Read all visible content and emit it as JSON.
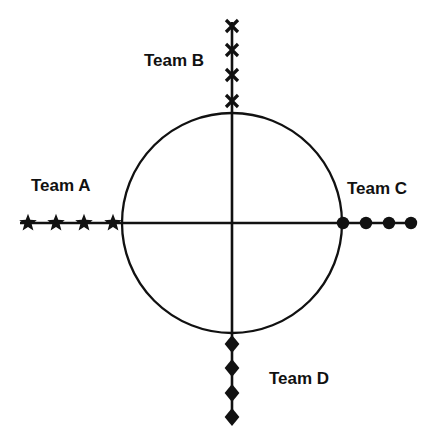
{
  "figure": {
    "title": "",
    "background_color": "#ffffff",
    "stroke_color": "#111111",
    "width": 431,
    "height": 440
  },
  "chart_data": {
    "type": "scatter",
    "title": "",
    "xlabel": "",
    "ylabel": "",
    "grid": false,
    "legend_position": "inline-axis-labels",
    "center": {
      "x": 232,
      "y": 223
    },
    "circle": {
      "cx": 232,
      "cy": 223,
      "r": 110,
      "label": "unit-circle"
    },
    "axes": {
      "horizontal": {
        "x1": 20,
        "x2": 415,
        "y": 223
      },
      "vertical": {
        "y1": 22,
        "y2": 420,
        "x": 232
      }
    },
    "series": [
      {
        "name": "Team A",
        "direction": "left",
        "marker": "star",
        "count": 4,
        "points": [
          {
            "x": 28,
            "y": 223
          },
          {
            "x": 56,
            "y": 223
          },
          {
            "x": 84,
            "y": 223
          },
          {
            "x": 113,
            "y": 223
          }
        ]
      },
      {
        "name": "Team B",
        "direction": "up",
        "marker": "x",
        "count": 4,
        "points": [
          {
            "x": 232,
            "y": 26
          },
          {
            "x": 232,
            "y": 50
          },
          {
            "x": 232,
            "y": 75
          },
          {
            "x": 232,
            "y": 101
          }
        ]
      },
      {
        "name": "Team C",
        "direction": "right",
        "marker": "circle",
        "count": 4,
        "points": [
          {
            "x": 343,
            "y": 223
          },
          {
            "x": 366,
            "y": 223
          },
          {
            "x": 389,
            "y": 223
          },
          {
            "x": 411,
            "y": 223
          }
        ]
      },
      {
        "name": "Team D",
        "direction": "down",
        "marker": "diamond",
        "count": 4,
        "points": [
          {
            "x": 232,
            "y": 344
          },
          {
            "x": 232,
            "y": 368
          },
          {
            "x": 232,
            "y": 393
          },
          {
            "x": 232,
            "y": 417
          }
        ]
      }
    ]
  },
  "labels": {
    "team_a": "Team A",
    "team_b": "Team B",
    "team_c": "Team C",
    "team_d": "Team D"
  }
}
